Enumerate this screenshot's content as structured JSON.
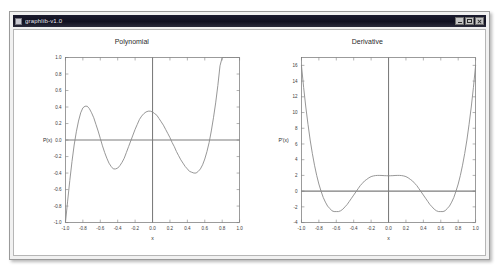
{
  "window": {
    "title": "graphlib-v1.0",
    "system_icon": "window-icon",
    "controls": [
      {
        "name": "minimize",
        "glyph": "_"
      },
      {
        "name": "maximize",
        "glyph": "□"
      },
      {
        "name": "close",
        "glyph": "×"
      }
    ]
  },
  "colors": {
    "titlebar_bg": "#101020",
    "titlebar_text": "#e9e9f2",
    "window_bg": "#f1f1f1",
    "plot_bg": "#ffffff",
    "curve": "#8a8a8a",
    "axis": "#7d7d7d",
    "frame": "#6f6f6f",
    "text": "#2b2b2b"
  },
  "chart_data": [
    {
      "type": "line",
      "title": "Polynomial",
      "xlabel": "x",
      "ylabel": "P(x)",
      "xlim": [
        -1.0,
        1.0
      ],
      "ylim": [
        -1.0,
        1.0
      ],
      "grid": false,
      "legend": "none",
      "xticks": [
        "-1.0",
        "-0.8",
        "-0.6",
        "-0.4",
        "-0.2",
        "0.0",
        "0.2",
        "0.4",
        "0.6",
        "0.8",
        "1.0"
      ],
      "xtick_values": [
        -1.0,
        -0.8,
        -0.6,
        -0.4,
        -0.2,
        0.0,
        0.2,
        0.4,
        0.6,
        0.8,
        1.0
      ],
      "yticks": [
        "1.0",
        "0.8",
        "0.6",
        "0.4",
        "0.2",
        "0.0",
        "-0.2",
        "-0.4",
        "-0.6",
        "-0.8",
        "-1.0"
      ],
      "ytick_values": [
        1.0,
        0.8,
        0.6,
        0.4,
        0.2,
        0.0,
        -0.2,
        -0.4,
        -0.6,
        -0.8,
        -1.0
      ],
      "series": [
        {
          "name": "P(x)",
          "x": [
            -1.0,
            -0.975,
            -0.95,
            -0.925,
            -0.9,
            -0.875,
            -0.85,
            -0.825,
            -0.8,
            -0.775,
            -0.75,
            -0.725,
            -0.7,
            -0.675,
            -0.65,
            -0.625,
            -0.6,
            -0.575,
            -0.55,
            -0.525,
            -0.5,
            -0.475,
            -0.45,
            -0.425,
            -0.4,
            -0.375,
            -0.35,
            -0.325,
            -0.3,
            -0.275,
            -0.25,
            -0.225,
            -0.2,
            -0.175,
            -0.15,
            -0.125,
            -0.1,
            -0.075,
            -0.05,
            -0.025,
            0.0,
            0.025,
            0.05,
            0.075,
            0.1,
            0.125,
            0.15,
            0.175,
            0.2,
            0.225,
            0.25,
            0.275,
            0.3,
            0.325,
            0.35,
            0.375,
            0.4,
            0.425,
            0.45,
            0.475,
            0.5,
            0.525,
            0.55,
            0.575,
            0.6,
            0.625,
            0.65,
            0.675,
            0.7,
            0.725,
            0.75,
            0.775,
            0.8,
            0.825,
            0.85,
            0.875,
            0.9,
            0.925,
            0.95,
            0.975,
            1.0
          ],
          "y": [
            -1.0,
            -0.74,
            -0.49,
            -0.26,
            -0.06,
            0.1,
            0.23,
            0.33,
            0.39,
            0.41,
            0.41,
            0.38,
            0.33,
            0.27,
            0.19,
            0.11,
            0.02,
            -0.07,
            -0.15,
            -0.22,
            -0.28,
            -0.32,
            -0.35,
            -0.35,
            -0.34,
            -0.31,
            -0.27,
            -0.22,
            -0.15,
            -0.08,
            -0.01,
            0.06,
            0.13,
            0.19,
            0.25,
            0.29,
            0.32,
            0.34,
            0.35,
            0.35,
            0.34,
            0.32,
            0.3,
            0.26,
            0.22,
            0.18,
            0.13,
            0.08,
            0.03,
            -0.03,
            -0.08,
            -0.14,
            -0.19,
            -0.24,
            -0.28,
            -0.32,
            -0.35,
            -0.38,
            -0.39,
            -0.4,
            -0.4,
            -0.38,
            -0.35,
            -0.3,
            -0.23,
            -0.14,
            -0.03,
            0.11,
            0.27,
            0.45,
            0.66,
            0.9,
            1.0,
            1.0,
            1.0,
            1.0,
            1.0,
            1.0,
            1.0,
            1.0,
            1.0
          ]
        }
      ]
    },
    {
      "type": "line",
      "title": "Derivative",
      "xlabel": "x",
      "ylabel": "P'(x)",
      "xlim": [
        -1.0,
        1.0
      ],
      "ylim": [
        -4,
        17
      ],
      "grid": false,
      "legend": "none",
      "xticks": [
        "-1.0",
        "-0.8",
        "-0.6",
        "-0.4",
        "-0.2",
        "0.0",
        "0.2",
        "0.4",
        "0.6",
        "0.8",
        "1.0"
      ],
      "xtick_values": [
        -1.0,
        -0.8,
        -0.6,
        -0.4,
        -0.2,
        0.0,
        0.2,
        0.4,
        0.6,
        0.8,
        1.0
      ],
      "yticks": [
        "16",
        "14",
        "12",
        "10",
        "8",
        "6",
        "4",
        "2",
        "0",
        "-2",
        "-4"
      ],
      "ytick_values": [
        16,
        14,
        12,
        10,
        8,
        6,
        4,
        2,
        0,
        -2,
        -4
      ],
      "series": [
        {
          "name": "P'(x)",
          "x": [
            -1.0,
            -0.975,
            -0.95,
            -0.925,
            -0.9,
            -0.875,
            -0.85,
            -0.825,
            -0.8,
            -0.775,
            -0.75,
            -0.725,
            -0.7,
            -0.675,
            -0.65,
            -0.625,
            -0.6,
            -0.575,
            -0.55,
            -0.525,
            -0.5,
            -0.475,
            -0.45,
            -0.425,
            -0.4,
            -0.375,
            -0.35,
            -0.325,
            -0.3,
            -0.275,
            -0.25,
            -0.225,
            -0.2,
            -0.175,
            -0.15,
            -0.125,
            -0.1,
            -0.075,
            -0.05,
            -0.025,
            0.0,
            0.025,
            0.05,
            0.075,
            0.1,
            0.125,
            0.15,
            0.175,
            0.2,
            0.225,
            0.25,
            0.275,
            0.3,
            0.325,
            0.35,
            0.375,
            0.4,
            0.425,
            0.45,
            0.475,
            0.5,
            0.525,
            0.55,
            0.575,
            0.6,
            0.625,
            0.65,
            0.675,
            0.7,
            0.725,
            0.75,
            0.775,
            0.8,
            0.825,
            0.85,
            0.875,
            0.9,
            0.925,
            0.95,
            0.975,
            1.0
          ],
          "y": [
            16.0,
            13.2,
            10.7,
            8.5,
            6.5,
            4.8,
            3.3,
            2.0,
            0.9,
            0.0,
            -0.8,
            -1.4,
            -1.9,
            -2.2,
            -2.5,
            -2.6,
            -2.6,
            -2.6,
            -2.5,
            -2.3,
            -2.0,
            -1.7,
            -1.3,
            -0.9,
            -0.5,
            -0.1,
            0.3,
            0.7,
            1.0,
            1.3,
            1.5,
            1.7,
            1.85,
            1.93,
            1.98,
            2.0,
            2.0,
            1.99,
            1.97,
            1.96,
            1.95,
            1.96,
            1.97,
            1.99,
            2.0,
            2.0,
            1.98,
            1.93,
            1.85,
            1.7,
            1.5,
            1.3,
            1.0,
            0.7,
            0.3,
            -0.1,
            -0.5,
            -0.9,
            -1.3,
            -1.7,
            -2.0,
            -2.3,
            -2.5,
            -2.6,
            -2.6,
            -2.6,
            -2.5,
            -2.2,
            -1.9,
            -1.4,
            -0.8,
            0.0,
            0.9,
            2.0,
            3.3,
            4.8,
            6.5,
            8.5,
            10.7,
            13.2,
            16.0
          ]
        }
      ]
    }
  ]
}
